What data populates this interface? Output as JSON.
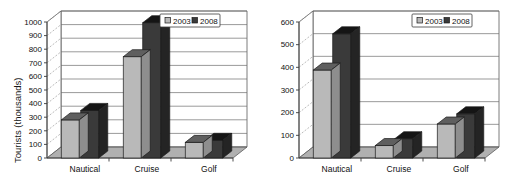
{
  "page": {
    "background": "#ffffff",
    "figure_count": 2
  },
  "palette": {
    "series_2003_front": "#b9b9b9",
    "series_2003_top": "#5f5f5f",
    "series_2003_side": "#8e8e8e",
    "series_2008_front": "#3a3a3a",
    "series_2008_top": "#151515",
    "series_2008_side": "#242424",
    "floor": "#b0b0b0",
    "wall": "#ffffff",
    "gridline": "#6e6e6e",
    "axis": "#3a3a3a",
    "text": "#111111"
  },
  "charts": [
    {
      "id": "tourists-chart",
      "title": "",
      "ylabel": "Tourists (thousands)",
      "xlabel": "",
      "categories": [
        "Nautical",
        "Cruise",
        "Golf"
      ],
      "yticks": [
        "0",
        "100",
        "200",
        "300",
        "400",
        "500",
        "600",
        "700",
        "800",
        "900",
        "1000"
      ],
      "legend": [
        "2003",
        "2008"
      ]
    },
    {
      "id": "income-chart",
      "title": "",
      "ylabel": "Total income (million Euros)",
      "xlabel": "",
      "categories": [
        "Nautical",
        "Cruise",
        "Golf"
      ],
      "yticks": [
        "0",
        "100",
        "200",
        "300",
        "400",
        "500",
        "600"
      ],
      "legend": [
        "2003",
        "2008"
      ]
    }
  ],
  "chart_data": [
    {
      "type": "bar",
      "id": "tourists-chart",
      "title": "",
      "subtitle": "",
      "xlabel": "",
      "ylabel": "Tourists (thousands)",
      "categories": [
        "Nautical",
        "Cruise",
        "Golf"
      ],
      "series": [
        {
          "name": "2003",
          "values": [
            280,
            745,
            115
          ]
        },
        {
          "name": "2008",
          "values": [
            350,
            995,
            130
          ]
        }
      ],
      "ylim": [
        0,
        1000
      ],
      "ytick_step": 100,
      "yticks": [
        0,
        100,
        200,
        300,
        400,
        500,
        600,
        700,
        800,
        900,
        1000
      ],
      "grid": true,
      "grid_axis": "y",
      "legend": [
        "2003",
        "2008"
      ],
      "legend_position": "top-right",
      "style": "3d-column",
      "annotations": []
    },
    {
      "type": "bar",
      "id": "income-chart",
      "title": "",
      "subtitle": "",
      "xlabel": "",
      "ylabel": "Total income (million Euros)",
      "categories": [
        "Nautical",
        "Cruise",
        "Golf"
      ],
      "series": [
        {
          "name": "2003",
          "values": [
            388,
            55,
            150
          ]
        },
        {
          "name": "2008",
          "values": [
            548,
            85,
            195
          ]
        }
      ],
      "ylim": [
        0,
        600
      ],
      "ytick_step": 100,
      "yticks": [
        0,
        100,
        200,
        300,
        400,
        500,
        600
      ],
      "grid": true,
      "grid_axis": "y",
      "legend": [
        "2003",
        "2008"
      ],
      "legend_position": "top-right",
      "style": "3d-column",
      "annotations": []
    }
  ]
}
